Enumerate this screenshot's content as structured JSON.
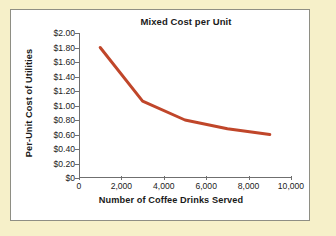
{
  "figure": {
    "background_color": "#f6f0c9",
    "card_background": "#ffffff",
    "card_border_color": "#8e8e84"
  },
  "chart_data": {
    "type": "line",
    "title": "Mixed Cost per Unit",
    "xlabel": "Number of Coffee Drinks Served",
    "ylabel": "Per-Unit Cost of Utilities",
    "x": [
      1000,
      3000,
      5000,
      7000,
      9000
    ],
    "values": [
      1.8,
      1.06,
      0.8,
      0.68,
      0.6
    ],
    "series": [
      {
        "name": "Per-unit cost of utilities",
        "color": "#c0462a",
        "x": [
          1000,
          3000,
          5000,
          7000,
          9000
        ],
        "values": [
          1.8,
          1.06,
          0.8,
          0.68,
          0.6
        ]
      }
    ],
    "xlim": [
      0,
      10000
    ],
    "ylim": [
      0,
      2.0
    ],
    "grid": false,
    "legend": null,
    "x_ticks": [
      0,
      2000,
      4000,
      6000,
      8000,
      10000
    ],
    "x_tick_labels": [
      "0",
      "2,000",
      "4,000",
      "6,000",
      "8,000",
      "10,000"
    ],
    "y_ticks": [
      0,
      0.2,
      0.4,
      0.6,
      0.8,
      1.0,
      1.2,
      1.4,
      1.6,
      1.8,
      2.0
    ],
    "y_tick_labels": [
      "$0",
      "$0.20",
      "$0.40",
      "$0.60",
      "$0.80",
      "$1.00",
      "$1.20",
      "$1.40",
      "$1.60",
      "$1.80",
      "$2.00"
    ],
    "line_color": "#c0462a",
    "line_width": 3,
    "axis_color": "#6f6f6f"
  }
}
